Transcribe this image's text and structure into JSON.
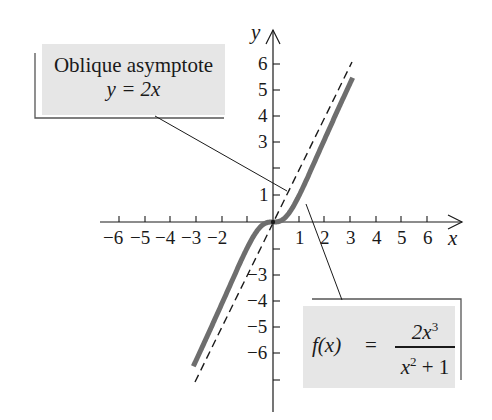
{
  "chart_data": {
    "type": "line",
    "title": "",
    "xlabel": "x",
    "ylabel": "y",
    "xlim": [
      -6.5,
      7
    ],
    "ylim": [
      -6.5,
      7
    ],
    "grid": false,
    "x_ticks": [
      -6,
      -5,
      -4,
      -3,
      -2,
      -1,
      1,
      2,
      3,
      4,
      5,
      6
    ],
    "x_tick_labels": [
      "−6",
      "−5",
      "−4",
      "−3",
      "−2",
      "1",
      "2",
      "3",
      "4",
      "5",
      "6"
    ],
    "y_ticks": [
      -6,
      -5,
      -4,
      -3,
      -2,
      -1,
      1,
      2,
      3,
      4,
      5,
      6
    ],
    "y_tick_labels": [
      "−6",
      "−5",
      "−4",
      "−3",
      "1",
      "3",
      "4",
      "5",
      "6"
    ],
    "series": [
      {
        "name": "f(x) = 2x^3/(x^2+1)",
        "style": "solid-thick-gray",
        "x": [
          -3.1,
          -2.5,
          -2,
          -1.5,
          -1,
          -0.5,
          0,
          0.5,
          1,
          1.5,
          2,
          2.5,
          3.1
        ],
        "y": [
          -5.64,
          -4.31,
          -3.2,
          -2.08,
          -1.0,
          -0.2,
          0,
          0.2,
          1.0,
          2.08,
          3.2,
          4.31,
          5.64
        ]
      },
      {
        "name": "Oblique asymptote y = 2x",
        "style": "dashed",
        "x": [
          -3.1,
          3.1
        ],
        "y": [
          -6.2,
          6.2
        ]
      }
    ],
    "annotations": [
      {
        "text": "Oblique asymptote y = 2x",
        "points_to": "asymptote near (0.6, 1.2)"
      },
      {
        "text": "f(x) = 2x^3/(x^2+1)",
        "points_to": "curve near (1.3, 0.7)"
      }
    ]
  },
  "labels": {
    "asymptote_line1": "Oblique asymptote",
    "asymptote_line2": "y = 2x",
    "fx_left": "f(x)",
    "fx_eq": "=",
    "fx_num": "2x",
    "fx_num_exp": "3",
    "fx_den": "x",
    "fx_den_exp": "2",
    "fx_den_rest": " + 1",
    "x_axis": "x",
    "y_axis": "y"
  },
  "ticks": {
    "x": [
      "−6",
      "−5",
      "−4",
      "−3",
      "−2",
      "1",
      "2",
      "3",
      "4",
      "5",
      "6"
    ],
    "y": [
      "6",
      "5",
      "4",
      "3",
      "1",
      "−3",
      "−4",
      "−5",
      "−6"
    ]
  },
  "colors": {
    "curve": "#6e6e6e",
    "asymptote": "#1a1a1a",
    "label_fill": "#e6e6e6",
    "frame": "#555555"
  }
}
